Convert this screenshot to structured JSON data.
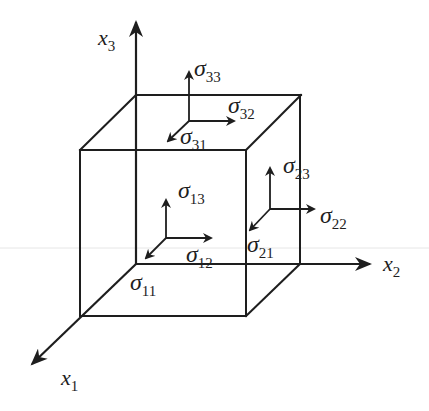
{
  "diagram": {
    "colors": {
      "stroke": "#1e1e1e",
      "background": "#ffffff"
    },
    "axes": [
      {
        "id": "x1",
        "symbol": "x",
        "subscript": "1",
        "direction": "out-of-page (down-left)"
      },
      {
        "id": "x2",
        "symbol": "x",
        "subscript": "2",
        "direction": "right"
      },
      {
        "id": "x3",
        "symbol": "x",
        "subscript": "3",
        "direction": "up"
      }
    ],
    "faces": [
      {
        "id": "top-face",
        "normal": "x3",
        "components": [
          {
            "symbol": "σ",
            "subscript": "33",
            "direction": "up"
          },
          {
            "symbol": "σ",
            "subscript": "32",
            "direction": "right"
          },
          {
            "symbol": "σ",
            "subscript": "31",
            "direction": "down-left"
          }
        ]
      },
      {
        "id": "front-face",
        "normal": "x1",
        "components": [
          {
            "symbol": "σ",
            "subscript": "13",
            "direction": "up"
          },
          {
            "symbol": "σ",
            "subscript": "12",
            "direction": "right"
          },
          {
            "symbol": "σ",
            "subscript": "11",
            "direction": "down-left"
          }
        ]
      },
      {
        "id": "right-face",
        "normal": "x2",
        "components": [
          {
            "symbol": "σ",
            "subscript": "23",
            "direction": "up"
          },
          {
            "symbol": "σ",
            "subscript": "22",
            "direction": "right"
          },
          {
            "symbol": "σ",
            "subscript": "21",
            "direction": "down-left"
          }
        ]
      }
    ]
  }
}
